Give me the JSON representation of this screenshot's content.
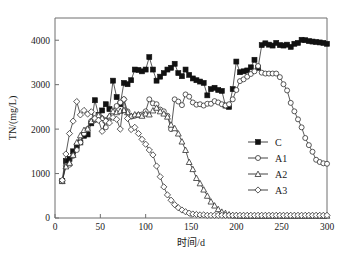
{
  "chart_data": {
    "type": "line",
    "title": "",
    "xlabel": "时间/d",
    "ylabel": "TN/(mg/L)",
    "xlim": [
      0,
      300
    ],
    "ylim": [
      0,
      4500
    ],
    "xticks": [
      0,
      50,
      100,
      150,
      200,
      250,
      300
    ],
    "yticks": [
      0,
      1000,
      2000,
      3000,
      4000
    ],
    "grid": false,
    "legend_position": "center-right",
    "series": [
      {
        "name": "C",
        "marker": "filled-square",
        "x": [
          8,
          12,
          16,
          20,
          24,
          28,
          32,
          36,
          40,
          44,
          48,
          52,
          56,
          60,
          64,
          68,
          72,
          76,
          80,
          84,
          88,
          92,
          96,
          100,
          104,
          108,
          112,
          116,
          120,
          124,
          128,
          132,
          136,
          140,
          144,
          148,
          152,
          156,
          160,
          164,
          168,
          172,
          176,
          180,
          184,
          188,
          192,
          196,
          200,
          204,
          208,
          212,
          216,
          220,
          224,
          228,
          232,
          236,
          240,
          244,
          248,
          252,
          256,
          260,
          264,
          268,
          272,
          276,
          280,
          284,
          288,
          292,
          296,
          300
        ],
        "y": [
          830,
          1280,
          1330,
          1500,
          1620,
          1700,
          1850,
          1880,
          2130,
          2650,
          2320,
          2420,
          2560,
          2450,
          3090,
          2720,
          2560,
          3040,
          3010,
          3100,
          3340,
          3330,
          3300,
          3340,
          3620,
          3340,
          3090,
          3180,
          3260,
          3340,
          3380,
          3470,
          3260,
          3190,
          3340,
          3220,
          3140,
          3100,
          3070,
          3040,
          2760,
          2900,
          2930,
          2880,
          2860,
          2530,
          2500,
          2900,
          3520,
          3280,
          3300,
          3320,
          3390,
          3560,
          3380,
          3890,
          3930,
          3900,
          3880,
          3940,
          3890,
          3880,
          3900,
          3850,
          3920,
          3940,
          4010,
          4000,
          3980,
          3970,
          3960,
          3950,
          3940,
          3920
        ]
      },
      {
        "name": "A1",
        "marker": "open-circle",
        "x": [
          8,
          12,
          16,
          20,
          24,
          28,
          32,
          36,
          40,
          44,
          48,
          52,
          56,
          60,
          64,
          68,
          72,
          76,
          80,
          84,
          88,
          92,
          96,
          100,
          104,
          108,
          112,
          116,
          120,
          124,
          128,
          132,
          136,
          140,
          144,
          148,
          152,
          156,
          160,
          164,
          168,
          172,
          176,
          180,
          184,
          188,
          192,
          196,
          200,
          204,
          208,
          212,
          216,
          220,
          224,
          228,
          232,
          236,
          240,
          244,
          248,
          252,
          256,
          260,
          264,
          268,
          272,
          276,
          280,
          284,
          288,
          292,
          296,
          300
        ],
        "y": [
          830,
          1180,
          1200,
          1400,
          1530,
          1700,
          1900,
          2000,
          2180,
          2200,
          2310,
          2240,
          2040,
          2260,
          2420,
          2520,
          2600,
          2670,
          2400,
          2280,
          2300,
          2320,
          2330,
          2400,
          2670,
          2580,
          2560,
          2440,
          2400,
          2300,
          2000,
          2670,
          2620,
          2540,
          2780,
          2730,
          2600,
          2550,
          2560,
          2530,
          2570,
          2570,
          2630,
          2600,
          2560,
          2530,
          2560,
          2670,
          2880,
          3080,
          3120,
          3180,
          3240,
          3300,
          3420,
          3270,
          3250,
          3250,
          3250,
          3250,
          3170,
          3010,
          2870,
          2590,
          2400,
          2220,
          2040,
          1800,
          1640,
          1490,
          1310,
          1260,
          1230,
          1220
        ]
      },
      {
        "name": "A2",
        "marker": "open-triangle",
        "x": [
          8,
          12,
          16,
          20,
          24,
          28,
          32,
          36,
          40,
          44,
          48,
          52,
          56,
          60,
          64,
          68,
          72,
          76,
          80,
          84,
          88,
          92,
          96,
          100,
          104,
          108,
          112,
          116,
          120,
          124,
          128,
          132,
          136,
          140,
          144,
          148,
          152,
          156,
          160,
          164,
          168,
          172,
          176,
          180,
          184,
          188,
          192,
          196,
          200,
          204,
          208,
          212,
          216,
          220,
          224,
          228,
          232,
          236,
          240,
          244,
          248,
          252,
          256,
          260,
          264,
          268,
          272,
          276,
          280,
          284,
          288,
          292,
          296,
          300
        ],
        "y": [
          830,
          1160,
          1240,
          1420,
          1700,
          1860,
          1980,
          2010,
          2180,
          2230,
          2310,
          2250,
          2200,
          2300,
          2400,
          2380,
          2410,
          2430,
          2380,
          2300,
          2330,
          2330,
          2300,
          2350,
          2330,
          2420,
          2480,
          2400,
          2350,
          2280,
          2100,
          2020,
          1900,
          1720,
          1530,
          1260,
          1100,
          900,
          780,
          640,
          500,
          370,
          280,
          200,
          140,
          110,
          80,
          60,
          60,
          50,
          50,
          50,
          50,
          50,
          50,
          50,
          50,
          50,
          50,
          50,
          50,
          50,
          50,
          50,
          50,
          50,
          50,
          50,
          50,
          50,
          50,
          50,
          50,
          50
        ]
      },
      {
        "name": "A3",
        "marker": "open-diamond",
        "x": [
          8,
          12,
          16,
          20,
          24,
          28,
          32,
          36,
          40,
          44,
          48,
          52,
          56,
          60,
          64,
          68,
          72,
          76,
          80,
          84,
          88,
          92,
          96,
          100,
          104,
          108,
          112,
          116,
          120,
          124,
          128,
          132,
          136,
          140,
          144,
          148,
          152,
          156,
          160,
          164,
          168,
          172,
          176,
          180,
          184,
          188,
          192,
          196,
          200,
          204,
          208,
          212,
          216,
          220,
          224,
          228,
          232,
          236,
          240,
          244,
          248,
          252,
          256,
          260,
          264,
          268,
          272,
          276,
          280,
          284,
          288,
          292,
          296,
          300
        ],
        "y": [
          850,
          1440,
          1900,
          2180,
          2620,
          2320,
          2420,
          2340,
          2390,
          2240,
          2200,
          1950,
          2180,
          2140,
          2260,
          2220,
          2000,
          2670,
          2240,
          1990,
          2040,
          1900,
          1770,
          1660,
          1530,
          1420,
          1170,
          930,
          700,
          520,
          400,
          300,
          230,
          180,
          140,
          110,
          90,
          80,
          70,
          70,
          60,
          60,
          60,
          60,
          60,
          60,
          60,
          60,
          60,
          60,
          60,
          60,
          60,
          60,
          60,
          60,
          60,
          60,
          60,
          60,
          60,
          60,
          60,
          60,
          60,
          60,
          60,
          60,
          60,
          60,
          60,
          60,
          60,
          60
        ]
      }
    ]
  },
  "legend": {
    "entries": [
      {
        "label": "C",
        "marker": "filled-square"
      },
      {
        "label": "A1",
        "marker": "open-circle"
      },
      {
        "label": "A2",
        "marker": "open-triangle"
      },
      {
        "label": "A3",
        "marker": "open-diamond"
      }
    ]
  },
  "colors": {
    "axis": "#6e6e6e",
    "series": "#303030",
    "marker_fill": "#ffffff",
    "marker_fill_solid": "#111111",
    "background": "#ffffff",
    "text": "#1a1a1a"
  }
}
